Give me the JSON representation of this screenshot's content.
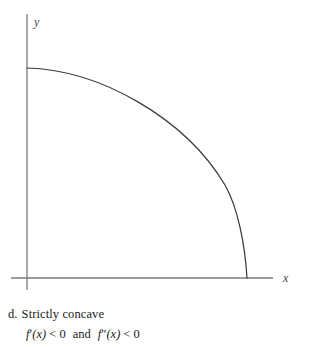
{
  "figure": {
    "axes": {
      "x_label": "x",
      "y_label": "y",
      "origin": [
        27,
        278
      ],
      "x_axis_from": [
        11,
        278
      ],
      "x_axis_to": [
        273,
        278
      ],
      "y_axis_from": [
        27,
        14
      ],
      "y_axis_to": [
        27,
        290
      ],
      "axis_color": "#7a7a7a"
    },
    "curve": {
      "color": "#3a3a3a",
      "description": "strictly-decreasing strictly-concave arc",
      "start_point": [
        27,
        68
      ],
      "end_point": [
        247,
        278
      ],
      "shape": "quarter-ellipse"
    }
  },
  "caption": {
    "marker": "d.",
    "text": "Strictly concave"
  },
  "condition": {
    "first_derivative": "f",
    "first_prime": "′",
    "first_arg": "(x)",
    "first_relation": "< 0",
    "conjunction": "and",
    "second_derivative": "f",
    "second_prime": "″",
    "second_arg": "(x)",
    "second_relation": "< 0"
  },
  "colors": {
    "background": "#ffffff",
    "text": "#1a1a1a",
    "axis": "#7a7a7a",
    "curve": "#3a3a3a"
  }
}
